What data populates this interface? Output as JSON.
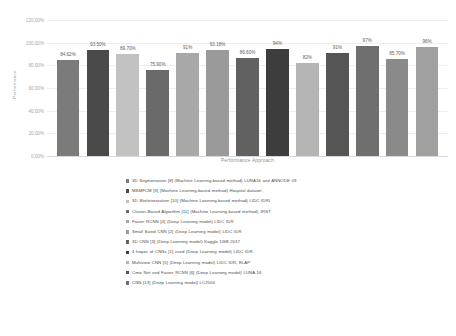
{
  "chart_data": {
    "type": "bar",
    "title": "",
    "xlabel": "Performance Approach",
    "ylabel": "Performance",
    "ylim": [
      0,
      1.2
    ],
    "grid": true,
    "legend_position": "bottom",
    "y_ticks": [
      "0.00%",
      "20.00%",
      "40.00%",
      "60.00%",
      "80.00%",
      "100.00%",
      "120.00%"
    ],
    "y_tick_values": [
      0,
      0.2,
      0.4,
      0.6,
      0.8,
      1.0,
      1.2
    ],
    "categories": [
      "3D Segmentation [8]",
      "MSMFCM [9]",
      "3D Skeletonization [10]",
      "Cluster-Based Algorithm [11]",
      "Faster RCNN [4]",
      "Small Sized CNN [2]",
      "3D CNN [3]",
      "4 hopes of CNNs [1]",
      "Multiview CNN [5]",
      "Cmix Net and Faster RCNN [6]",
      "CNN [13]",
      "Bar 12",
      "Bar 13"
    ],
    "values": [
      0.8462,
      0.935,
      0.897,
      0.759,
      0.91,
      0.9318,
      0.866,
      0.94,
      0.82,
      0.91,
      0.97,
      0.857,
      0.96
    ],
    "data_labels": [
      "84.62%",
      "93.50%",
      "89.70%",
      "75.90%",
      "91%",
      "93.18%",
      "86.60%",
      "94%",
      "82%",
      "91%",
      "97%",
      "85.70%",
      "96%"
    ],
    "bar_colors": [
      "#7b7b7b",
      "#4a4a4a",
      "#c2c2c2",
      "#6a6a6a",
      "#a8a8a8",
      "#9a9a9a",
      "#616161",
      "#3d3d3d",
      "#b5b5b5",
      "#555555",
      "#6f6f6f",
      "#8a8a8a",
      "#a0a0a0"
    ]
  },
  "legend": {
    "items": [
      {
        "label": "3D Segmentation [8] (Machine Learning-based method) LUNA16 and ANNODE 09",
        "color": "#7b7b7b"
      },
      {
        "label": "MSMFCM [9] (Machine Learning-based method) Hospital dataset",
        "color": "#4a4a4a"
      },
      {
        "label": "3D Skeletonization [10] (Machine Learning-based method) LIDC IDRI",
        "color": "#c2c2c2"
      },
      {
        "label": "Cluster-Based Algorithm [11] (Machine Learning-based method) JRST",
        "color": "#6a6a6a"
      },
      {
        "label": "Faster RCNN [4] (Deep Learning model) LIDC IDR",
        "color": "#a8a8a8"
      },
      {
        "label": "Small Sized CNN [2] (Deep Learning model) LIDC IDR",
        "color": "#9a9a9a"
      },
      {
        "label": "3D CNN [3] (Deep Learning model) Kaggle DSB 2017",
        "color": "#616161"
      },
      {
        "label": "4 hopes of CNNs [1] used (Deep Learning model) LIDC IDR",
        "color": "#3d3d3d"
      },
      {
        "label": "Multiview CNN [5] (Deep Learning model) LIDC IDR, ELAP",
        "color": "#b5b5b5"
      },
      {
        "label": "Cmix Net and Faster RCNN [6] (Deep Learning model)  LUNA 16",
        "color": "#555555"
      },
      {
        "label": "CNN [13] (Deep Learning model) LC2500",
        "color": "#6f6f6f"
      }
    ]
  }
}
